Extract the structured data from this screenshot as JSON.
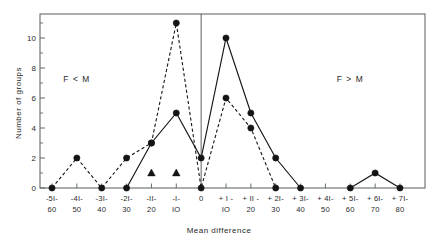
{
  "chart_data": {
    "type": "line",
    "title": "",
    "xlabel": "Mean difference",
    "ylabel": "Number of groups",
    "ylim": [
      0,
      11.6
    ],
    "yticks": [
      0,
      2,
      4,
      6,
      8,
      10
    ],
    "ytick_labels": [
      "0",
      "2",
      "4",
      "6",
      "8",
      "10"
    ],
    "minor_yticks": [
      1,
      3,
      5,
      7,
      9,
      11
    ],
    "grid": false,
    "legend": "none",
    "categories": [
      "-51/-60",
      "-41/-50",
      "-31/-40",
      "-21/-30",
      "-11/-20",
      "-1/-10",
      "0",
      "+1/+10",
      "+11/+20",
      "+21/+30",
      "+31/+40",
      "+41/+50",
      "+51/+60",
      "+61/+70",
      "+71/+80"
    ],
    "xtick_labels_top": [
      "-5I-",
      "-4I-",
      "-3I-",
      "-2I-",
      "-II-",
      "-I-",
      "0",
      "+ I -",
      "+ II -",
      "+ 2I-",
      "+ 3I-",
      "+ 4I-",
      "+ 5I-",
      "+ 6I-",
      "+ 7I-"
    ],
    "xtick_labels_bottom": [
      "60",
      "50",
      "40",
      "30",
      "20",
      "IO",
      "",
      "IO",
      "20",
      "30",
      "40",
      "50",
      "60",
      "70",
      "80"
    ],
    "series": [
      {
        "name": "solid",
        "linestyle": "solid",
        "marker": "circle",
        "points": [
          {
            "x": "-21/-30",
            "y": 0
          },
          {
            "x": "-11/-20",
            "y": 3
          },
          {
            "x": "-1/-10",
            "y": 5
          },
          {
            "x": "0",
            "y": 2
          },
          {
            "x": "+1/+10",
            "y": 10
          },
          {
            "x": "+11/+20",
            "y": 5
          },
          {
            "x": "+21/+30",
            "y": 2
          },
          {
            "x": "+31/+40",
            "y": 0
          }
        ]
      },
      {
        "name": "solid-tail",
        "linestyle": "solid",
        "marker": "circle",
        "points": [
          {
            "x": "+51/+60",
            "y": 0
          },
          {
            "x": "+61/+70",
            "y": 1
          },
          {
            "x": "+71/+80",
            "y": 0
          }
        ]
      },
      {
        "name": "dashed",
        "linestyle": "dashed",
        "marker": "circle",
        "points": [
          {
            "x": "-51/-60",
            "y": 0
          },
          {
            "x": "-41/-50",
            "y": 2
          },
          {
            "x": "-31/-40",
            "y": 0
          },
          {
            "x": "-21/-30",
            "y": 2
          },
          {
            "x": "-11/-20",
            "y": 3
          },
          {
            "x": "-1/-10",
            "y": 11
          },
          {
            "x": "0",
            "y": 0
          },
          {
            "x": "+1/+10",
            "y": 6
          },
          {
            "x": "+11/+20",
            "y": 4
          },
          {
            "x": "+21/+30",
            "y": 0
          }
        ]
      },
      {
        "name": "triangles",
        "linestyle": "none",
        "marker": "triangle",
        "points": [
          {
            "x": "-11/-20",
            "y": 1
          },
          {
            "x": "-1/-10",
            "y": 1
          }
        ]
      }
    ],
    "reference_line": {
      "x": "0",
      "orientation": "vertical"
    },
    "annotations": [
      {
        "text": "F < M",
        "x": "-41/-50",
        "y": 7.1
      },
      {
        "text": "F > M",
        "x": "+51/+60",
        "y": 7.1
      }
    ]
  },
  "axis": {
    "ylabel": "Number of groups",
    "xlabel": "Mean difference"
  },
  "annotations": {
    "left": "F < M",
    "right": "F > M"
  }
}
